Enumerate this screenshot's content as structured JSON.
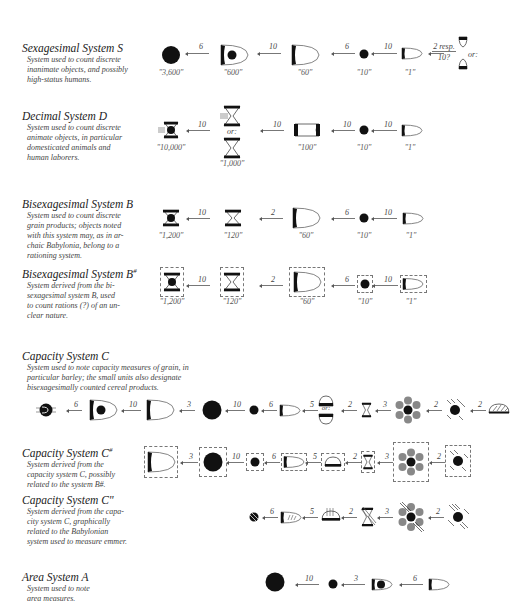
{
  "systems": [
    {
      "id": "S",
      "title": "Sexagesimal System S",
      "description": "System used to count discrete\ninanimate objects, and possibly\nhigh-status humans.",
      "signs": [
        {
          "glyph": "large-circle",
          "value": "\"3,600\""
        },
        {
          "glyph": "large-cone-with-circle",
          "value": "\"600\""
        },
        {
          "glyph": "large-cone",
          "value": "\"60\""
        },
        {
          "glyph": "small-circle",
          "value": "\"10\""
        },
        {
          "glyph": "small-cone",
          "value": "\"1\""
        }
      ],
      "factors": [
        "6",
        "10",
        "6",
        "10"
      ],
      "fraction_factor": {
        "top": "2 resp.",
        "bottom": "10?",
        "or_label": "or:"
      }
    },
    {
      "id": "D",
      "title": "Decimal System D",
      "description": "System used to count discrete\nanimate objects, in particular\ndomesticated animals and\nhuman laborers.",
      "signs": [
        {
          "glyph": "hourglass-with-circle-and-strokes",
          "value": "\"10,000\""
        },
        {
          "glyph": "hourglass-alternatives",
          "value": "\"1,000\"",
          "or_label": "or:"
        },
        {
          "glyph": "small-barrel",
          "value": "\"100\""
        },
        {
          "glyph": "small-circle",
          "value": "\"10\""
        },
        {
          "glyph": "small-cone",
          "value": "\"1\""
        }
      ],
      "factors": [
        "10",
        "10",
        "10",
        "10"
      ]
    },
    {
      "id": "B",
      "title": "Bisexagesimal System B",
      "description": "System used to count discrete\ngrain products; objects noted\nwith this system may, as in ar-\nchaic Babylonia, belong to a\nrationing system.",
      "signs": [
        {
          "glyph": "hourglass-with-circle",
          "value": "\"1,200\""
        },
        {
          "glyph": "hourglass",
          "value": "\"120\""
        },
        {
          "glyph": "large-cone",
          "value": "\"60\""
        },
        {
          "glyph": "small-circle",
          "value": "\"10\""
        },
        {
          "glyph": "small-cone",
          "value": "\"1\""
        }
      ],
      "factors": [
        "10",
        "2",
        "6",
        "10"
      ]
    },
    {
      "id": "B#",
      "title": "Bisexagesimal System B",
      "title_sup": "#",
      "description": "System derived from the bi-\nsexagesimal system B, used\nto count rations (?) of an un-\nclear nature.",
      "signs": [
        {
          "glyph": "hourglass-with-circle",
          "value": "\"1,200\"",
          "framed": true
        },
        {
          "glyph": "hourglass",
          "value": "\"120\"",
          "framed": true
        },
        {
          "glyph": "large-cone",
          "value": "\"60\"",
          "framed": true
        },
        {
          "glyph": "small-circle",
          "value": "\"10\"",
          "framed": true
        },
        {
          "glyph": "small-cone",
          "value": "\"1\"",
          "framed": true
        }
      ],
      "factors": [
        "10",
        "2",
        "6",
        "10"
      ]
    },
    {
      "id": "C",
      "title": "Capacity System C",
      "description": "System used to note capacity measures of grain, in\nparticular barley; the small units also designate\nbisexagesimally counted cereal products.",
      "signs": [
        {
          "glyph": "circle-with-cone-and-strokes"
        },
        {
          "glyph": "large-cone-with-circle"
        },
        {
          "glyph": "large-cone"
        },
        {
          "glyph": "large-circle"
        },
        {
          "glyph": "small-circle"
        },
        {
          "glyph": "small-cone"
        },
        {
          "glyph": "half-circle-alternatives",
          "or_label": "or:"
        },
        {
          "glyph": "small-hourglass"
        },
        {
          "glyph": "rosette-of-circles"
        },
        {
          "glyph": "circle-with-diagonal-strokes"
        },
        {
          "glyph": "hatched-dome"
        }
      ],
      "factors": [
        "6",
        "10",
        "3",
        "10",
        "6",
        "5",
        "2",
        "3",
        "2",
        "2"
      ]
    },
    {
      "id": "C#",
      "title": "Capacity System C",
      "title_sup": "#",
      "description": "System derived from the\ncapacity system C, possibly\nrelated to the system B#.",
      "signs": [
        {
          "glyph": "large-cone",
          "framed": true
        },
        {
          "glyph": "large-circle",
          "framed": true
        },
        {
          "glyph": "small-circle",
          "framed": true
        },
        {
          "glyph": "small-cone",
          "framed": true
        },
        {
          "glyph": "half-circle",
          "framed": true
        },
        {
          "glyph": "small-hourglass",
          "framed": true
        },
        {
          "glyph": "rosette-of-circles",
          "framed": true
        },
        {
          "glyph": "circle-with-diagonal-strokes",
          "framed": true
        }
      ],
      "factors": [
        "3",
        "10",
        "6",
        "5",
        "2",
        "3",
        "2"
      ]
    },
    {
      "id": "C\"",
      "title": "Capacity System C\"",
      "description": "System derived from the capa-\ncity system C, graphically\nrelated to the Babylonian\nsystem used to measure emmer.",
      "signs": [
        {
          "glyph": "hatched-small-circle"
        },
        {
          "glyph": "hatched-small-cone"
        },
        {
          "glyph": "hatched-half-circle"
        },
        {
          "glyph": "hatched-hourglass"
        },
        {
          "glyph": "hatched-rosette"
        },
        {
          "glyph": "hatched-circle-with-strokes"
        }
      ],
      "factors": [
        "6",
        "5",
        "2",
        "3",
        "2"
      ]
    },
    {
      "id": "A",
      "title": "Area  System A",
      "description": "System used to note\narea measures.",
      "signs": [
        {
          "glyph": "large-circle"
        },
        {
          "glyph": "small-circle"
        },
        {
          "glyph": "cone-with-circle"
        },
        {
          "glyph": "small-cone"
        }
      ],
      "factors": [
        "10",
        "3",
        "6"
      ]
    }
  ],
  "colors": {
    "ink": "#111111",
    "stroke": "#666666",
    "grey_circle": "#8a8a8a",
    "text": "#444444"
  }
}
